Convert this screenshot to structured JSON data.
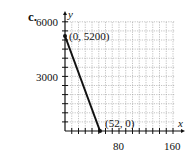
{
  "part_label": "c.",
  "chart_data": {
    "type": "line",
    "title": "",
    "xlabel": "x",
    "ylabel": "y",
    "xlim": [
      0,
      160
    ],
    "ylim": [
      0,
      6000
    ],
    "x_ticks": [
      80,
      160
    ],
    "y_ticks": [
      3000,
      6000
    ],
    "grid": true,
    "series": [
      {
        "name": "line",
        "x": [
          0,
          52
        ],
        "y": [
          5200,
          0
        ]
      }
    ],
    "annotations": [
      {
        "text": "(0, 5200)",
        "x": 0,
        "y": 5200
      },
      {
        "text": "(52, 0)",
        "x": 52,
        "y": 0
      }
    ]
  },
  "labels": {
    "x_axis": "x",
    "y_axis": "y",
    "ytick_6000": "6000",
    "ytick_3000": "3000",
    "xtick_80": "80",
    "xtick_160": "160",
    "pt1": "(0, 5200)",
    "pt2": "(52, 0)"
  }
}
